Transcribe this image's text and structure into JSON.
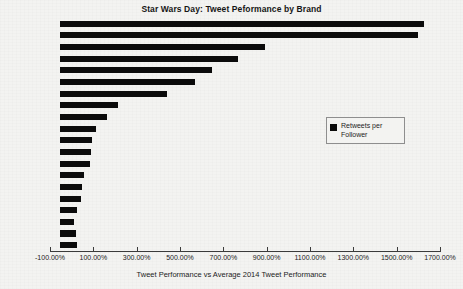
{
  "chart_data": {
    "type": "bar",
    "orientation": "horizontal",
    "title": "Star Wars Day: Tweet Peformance by Brand",
    "xlabel": "Tweet Performance vs Average 2014 Tweet Performance",
    "ylabel": "",
    "xlim": [
      -100,
      1700
    ],
    "xtick_step": 200,
    "grid": false,
    "legend_position": "center-right",
    "series": [
      {
        "name": "Retweets per Follower",
        "color": "#0b0b0b",
        "values": [
          1627.0,
          1600.0,
          891.0,
          766.0,
          646.0,
          568.0,
          439.0,
          212.0,
          163.0,
          111.0,
          92.0,
          88.0,
          85.0,
          57.0,
          49.0,
          45.0,
          26.0,
          12.0,
          18.0,
          23.0
        ]
      }
    ],
    "categories": [
      "Brand 1",
      "Brand 2",
      "Brand 3",
      "Brand 4",
      "Brand 5",
      "Brand 6",
      "Brand 7",
      "Brand 8",
      "Brand 9",
      "Brand 10",
      "Brand 11",
      "Brand 12",
      "Brand 13",
      "Brand 14",
      "Brand 15",
      "Brand 16",
      "Brand 17",
      "Brand 18",
      "Brand 19",
      "Brand 20"
    ],
    "xticklabels": [
      "-100.00%",
      "100.00%",
      "300.00%",
      "500.00%",
      "700.00%",
      "900.00%",
      "1100.00%",
      "1300.00%",
      "1500.00%",
      "1700.00%"
    ],
    "xtickvalues": [
      -100,
      100,
      300,
      500,
      700,
      900,
      1100,
      1300,
      1500,
      1700
    ]
  },
  "legend": {
    "entries": [
      {
        "label": "Retweets per Follower",
        "color": "#0b0b0b",
        "marker": "square"
      }
    ]
  }
}
